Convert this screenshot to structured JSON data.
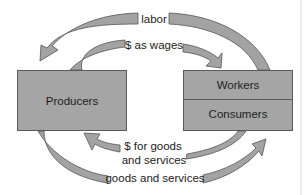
{
  "diagram": {
    "nodes": {
      "producers": "Producers",
      "workers": "Workers",
      "consumers": "Consumers"
    },
    "flows": {
      "labor": "labor",
      "wages": "$ as wages",
      "payment_line1": "$ for goods",
      "payment_line2": "and services",
      "goods": "goods and services"
    },
    "colors": {
      "box_fill": "#a5a5a5",
      "arrow_fill": "#a3a3a3",
      "outline": "#555555"
    }
  }
}
